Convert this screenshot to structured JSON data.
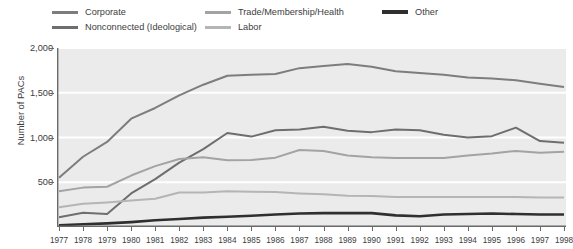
{
  "chart_data": {
    "type": "line",
    "title": "",
    "xlabel": "",
    "ylabel": "Number of PACs",
    "x": [
      1977,
      1978,
      1979,
      1980,
      1981,
      1982,
      1983,
      1984,
      1985,
      1986,
      1987,
      1988,
      1989,
      1990,
      1991,
      1992,
      1993,
      1994,
      1995,
      1996,
      1997,
      1998
    ],
    "xtick_labels": [
      "1977",
      "1978",
      "1979",
      "1980",
      "1981",
      "1982",
      "1983",
      "1984",
      "1985",
      "1986",
      "1987",
      "1988",
      "1989",
      "1990",
      "1991",
      "1992",
      "1993",
      "1994",
      "1995",
      "1996",
      "1997",
      "1998"
    ],
    "ytick_labels": [
      "500",
      "1,000",
      "1,500",
      "2,000"
    ],
    "yticks": [
      500,
      1000,
      1500,
      2000
    ],
    "ylim": [
      0,
      2000
    ],
    "grid": "horizontal-white",
    "legend_position": "top",
    "plot_background": "#ebebeb",
    "series": [
      {
        "name": "Corporate",
        "color": "#7d7d7d",
        "width": 2.0,
        "values": [
          550,
          785,
          950,
          1210,
          1330,
          1470,
          1590,
          1690,
          1700,
          1710,
          1775,
          1800,
          1820,
          1790,
          1740,
          1720,
          1700,
          1670,
          1660,
          1640,
          1600,
          1565
        ]
      },
      {
        "name": "Nonconnected (Ideological)",
        "color": "#6e6e6e",
        "width": 2.0,
        "values": [
          110,
          160,
          145,
          375,
          535,
          720,
          870,
          1050,
          1010,
          1080,
          1090,
          1120,
          1075,
          1060,
          1090,
          1080,
          1030,
          1000,
          1015,
          1110,
          960,
          940
        ]
      },
      {
        "name": "Trade/Membership/Health",
        "color": "#a3a3a3",
        "width": 2.0,
        "values": [
          400,
          440,
          450,
          575,
          680,
          760,
          780,
          745,
          750,
          775,
          860,
          850,
          800,
          780,
          770,
          770,
          770,
          800,
          820,
          850,
          830,
          840
        ]
      },
      {
        "name": "Labor",
        "color": "#b5b5b5",
        "width": 2.0,
        "values": [
          220,
          260,
          275,
          295,
          315,
          385,
          385,
          400,
          395,
          390,
          375,
          365,
          350,
          345,
          335,
          335,
          335,
          335,
          335,
          335,
          330,
          330
        ]
      },
      {
        "name": "Other",
        "color": "#2f2f2f",
        "width": 2.6,
        "values": [
          20,
          30,
          40,
          55,
          75,
          90,
          105,
          115,
          125,
          140,
          150,
          155,
          155,
          155,
          130,
          120,
          140,
          145,
          150,
          145,
          140,
          140
        ]
      }
    ]
  },
  "legend": {
    "items": [
      {
        "label": "Corporate"
      },
      {
        "label": "Nonconnected (Ideological)"
      },
      {
        "label": "Trade/Membership/Health"
      },
      {
        "label": "Labor"
      },
      {
        "label": "Other"
      }
    ]
  }
}
